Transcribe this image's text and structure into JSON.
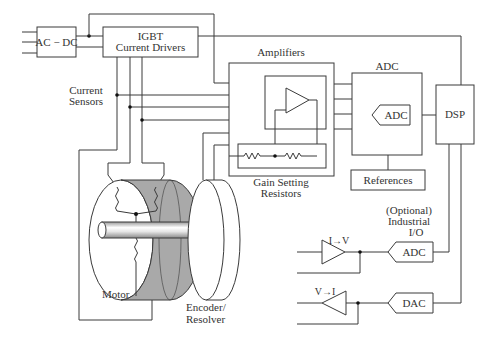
{
  "diagram": {
    "blocks": {
      "ac_dc": "AC − DC",
      "igbt_line1": "IGBT",
      "igbt_line2": "Current Drivers",
      "amplifiers": "Amplifiers",
      "adc_block_title": "ADC",
      "adc_inner": "ADC",
      "dsp": "DSP",
      "references": "References",
      "gain_line1": "Gain Setting",
      "gain_line2": "Resistors",
      "sensors_line1": "Current",
      "sensors_line2": "Sensors",
      "motor": "Motor",
      "encoder_line1": "Encoder/",
      "encoder_line2": "Resolver",
      "io_line1": "(Optional)",
      "io_line2": "Industrial",
      "io_line3": "I/O",
      "io_adc": "ADC",
      "io_dac": "DAC",
      "i_to_v": "I→V",
      "v_to_i": "V→I"
    },
    "colors": {
      "line": "#3a3a3a",
      "motor_body": "#a9a9a9",
      "background": "#ffffff"
    }
  }
}
